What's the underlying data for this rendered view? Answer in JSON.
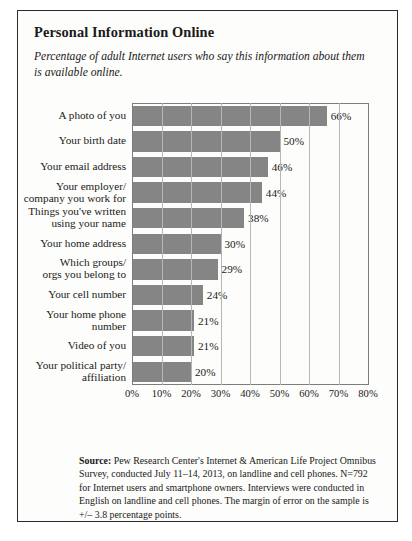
{
  "title": "Personal Information Online",
  "subtitle": "Percentage of adult Internet users who say this information about them is available online.",
  "source_label": "Source:",
  "source_text": " Pew Research Center's Internet & American Life Project Omnibus Survey, conducted July 11–14, 2013, on landline and cell phones. N=792 for Internet users and smartphone owners. Interviews were conducted in English on landline and cell phones. The margin of error on the sample is +/– 3.8 percentage points.",
  "bottom_caption": "",
  "colors": {
    "bar_fill": "#858585",
    "frame": "#2b2b2b",
    "gridline": "#b6b6b6",
    "axis": "#7d7d7d",
    "panel_bg": "#fdfdfb"
  },
  "chart_data": {
    "type": "bar",
    "orientation": "horizontal",
    "title": "Personal Information Online",
    "subtitle": "Percentage of adult Internet users who say this information about them is available online.",
    "xlabel": "",
    "ylabel": "",
    "xlim": [
      0,
      80
    ],
    "xticks": [
      "0%",
      "10%",
      "20%",
      "30%",
      "40%",
      "50%",
      "60%",
      "70%",
      "80%"
    ],
    "xtick_values": [
      0,
      10,
      20,
      30,
      40,
      50,
      60,
      70,
      80
    ],
    "grid": "vertical",
    "legend": "none",
    "categories": [
      "A photo of you",
      "Your birth date",
      "Your email address",
      "Your employer/\ncompany you work for",
      "Things you've written\nusing your name",
      "Your home address",
      "Which groups/\norgs you belong to",
      "Your cell number",
      "Your home phone\nnumber",
      "Video of you",
      "Your political party/\naffiliation"
    ],
    "values": [
      66,
      50,
      46,
      44,
      38,
      30,
      29,
      24,
      21,
      21,
      20
    ],
    "data_labels": [
      "66%",
      "50%",
      "46%",
      "44%",
      "38%",
      "30%",
      "29%",
      "24%",
      "21%",
      "21%",
      "20%"
    ]
  }
}
